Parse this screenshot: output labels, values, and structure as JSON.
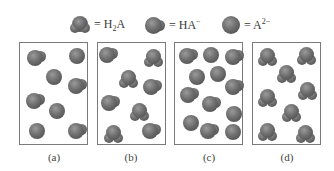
{
  "legend": [
    {
      "species": "H2A",
      "label_main": "= H",
      "label_sub": "2",
      "label_end": "A",
      "label_sup": "",
      "icon": "h2a-molecule-icon"
    },
    {
      "species": "HA-",
      "label_main": "= HA",
      "label_sub": "",
      "label_end": "",
      "label_sup": "−",
      "icon": "ha-minus-molecule-icon"
    },
    {
      "species": "A2-",
      "label_main": "= A",
      "label_sub": "",
      "label_end": "",
      "label_sup": "2−",
      "icon": "a-2minus-molecule-icon"
    }
  ],
  "panels": [
    {
      "label": "(a)",
      "counts": {
        "H2A": 0,
        "HA-": 4,
        "A2-": 4
      },
      "molecules": [
        {
          "type": "HA-",
          "x": 16,
          "y": 16
        },
        {
          "type": "A2-",
          "x": 57,
          "y": 13
        },
        {
          "type": "A2-",
          "x": 34,
          "y": 34
        },
        {
          "type": "HA-",
          "x": 57,
          "y": 44
        },
        {
          "type": "HA-",
          "x": 15,
          "y": 59
        },
        {
          "type": "A2-",
          "x": 37,
          "y": 68
        },
        {
          "type": "A2-",
          "x": 17,
          "y": 88
        },
        {
          "type": "HA-",
          "x": 57,
          "y": 89
        }
      ]
    },
    {
      "label": "(b)",
      "counts": {
        "H2A": 4,
        "HA-": 4,
        "A2-": 0
      },
      "molecules": [
        {
          "type": "HA-",
          "x": 10,
          "y": 13
        },
        {
          "type": "H2A",
          "x": 55,
          "y": 15
        },
        {
          "type": "H2A",
          "x": 30,
          "y": 36
        },
        {
          "type": "HA-",
          "x": 54,
          "y": 45
        },
        {
          "type": "HA-",
          "x": 12,
          "y": 61
        },
        {
          "type": "H2A",
          "x": 41,
          "y": 69
        },
        {
          "type": "H2A",
          "x": 15,
          "y": 91
        },
        {
          "type": "HA-",
          "x": 53,
          "y": 89
        }
      ]
    },
    {
      "label": "(c)",
      "counts": {
        "H2A": 0,
        "HA-": 6,
        "A2-": 6
      },
      "molecules": [
        {
          "type": "HA-",
          "x": 13,
          "y": 14
        },
        {
          "type": "A2-",
          "x": 36,
          "y": 12
        },
        {
          "type": "HA-",
          "x": 59,
          "y": 15
        },
        {
          "type": "A2-",
          "x": 22,
          "y": 34
        },
        {
          "type": "A2-",
          "x": 43,
          "y": 31
        },
        {
          "type": "HA-",
          "x": 59,
          "y": 45
        },
        {
          "type": "HA-",
          "x": 14,
          "y": 53
        },
        {
          "type": "HA-",
          "x": 36,
          "y": 62
        },
        {
          "type": "A2-",
          "x": 59,
          "y": 71
        },
        {
          "type": "A2-",
          "x": 16,
          "y": 80
        },
        {
          "type": "HA-",
          "x": 34,
          "y": 89
        },
        {
          "type": "A2-",
          "x": 58,
          "y": 89
        }
      ]
    },
    {
      "label": "(d)",
      "counts": {
        "H2A": 8,
        "HA-": 0,
        "A2-": 0
      },
      "molecules": [
        {
          "type": "H2A",
          "x": 14,
          "y": 14
        },
        {
          "type": "H2A",
          "x": 53,
          "y": 13
        },
        {
          "type": "H2A",
          "x": 33,
          "y": 31
        },
        {
          "type": "H2A",
          "x": 54,
          "y": 48
        },
        {
          "type": "H2A",
          "x": 14,
          "y": 55
        },
        {
          "type": "H2A",
          "x": 38,
          "y": 70
        },
        {
          "type": "H2A",
          "x": 14,
          "y": 89
        },
        {
          "type": "H2A",
          "x": 52,
          "y": 91
        }
      ]
    }
  ],
  "colors": {
    "sphere_light": "#9a9a9a",
    "sphere_mid": "#6e6e6e",
    "sphere_dark": "#454545",
    "border": "#7a7a7a"
  }
}
